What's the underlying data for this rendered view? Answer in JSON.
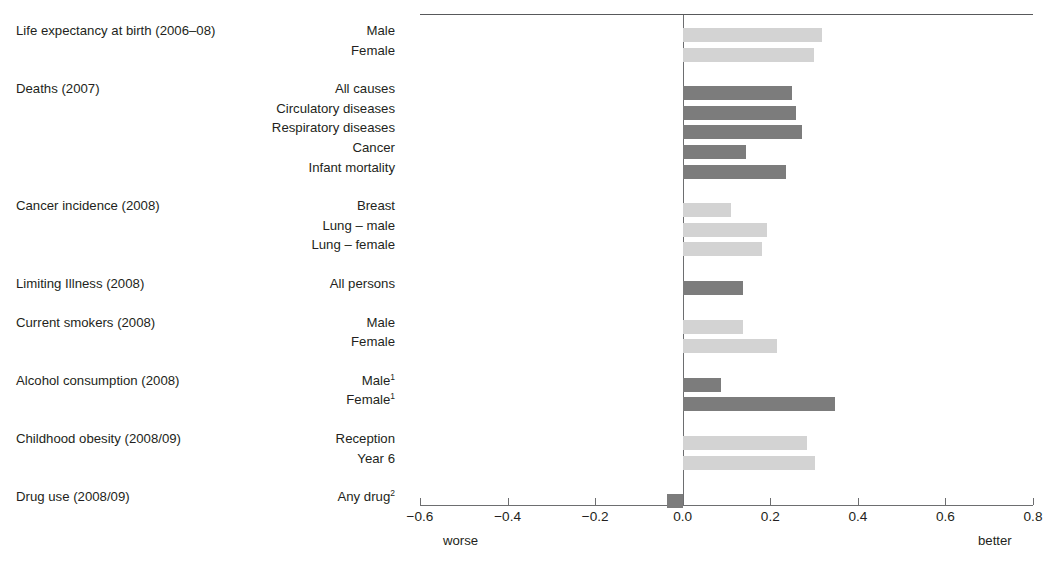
{
  "figure": {
    "cut_off_title_sliver": "",
    "axis": {
      "ticks": [
        "-0.6",
        "-0.4",
        "-0.2",
        "0.0",
        "0.2",
        "0.4",
        "0.6",
        "0.8"
      ],
      "tick_values": [
        -0.6,
        -0.4,
        -0.2,
        0.0,
        0.2,
        0.4,
        0.6,
        0.8
      ],
      "left_note": "worse",
      "right_note": "better"
    },
    "colors": {
      "bar_light": "#d3d3d3",
      "bar_dark": "#7c7c7c",
      "axis": "#6d6e70",
      "text": "#231f20"
    }
  },
  "chart_data": {
    "type": "bar",
    "orientation": "horizontal",
    "title": "",
    "xlabel": "",
    "ylabel": "",
    "xlim": [
      -0.6,
      0.8
    ],
    "grid": false,
    "legend": null,
    "axis_annotations": {
      "left": "worse",
      "right": "better"
    },
    "groups": [
      {
        "group": "Life expectancy at birth (2006–08)",
        "items": [
          {
            "label": "Male",
            "value": 0.317,
            "shade": "light"
          },
          {
            "label": "Female",
            "value": 0.301,
            "shade": "light"
          }
        ]
      },
      {
        "group": "Deaths (2007)",
        "items": [
          {
            "label": "All causes",
            "value": 0.25,
            "shade": "dark"
          },
          {
            "label": "Circulatory diseases",
            "value": 0.258,
            "shade": "dark"
          },
          {
            "label": "Respiratory diseases",
            "value": 0.272,
            "shade": "dark"
          },
          {
            "label": "Cancer",
            "value": 0.145,
            "shade": "dark"
          },
          {
            "label": "Infant mortality",
            "value": 0.237,
            "shade": "dark"
          }
        ]
      },
      {
        "group": "Cancer incidence (2008)",
        "items": [
          {
            "label": "Breast",
            "value": 0.11,
            "shade": "light"
          },
          {
            "label": "Lung – male",
            "value": 0.192,
            "shade": "light"
          },
          {
            "label": "Lung – female",
            "value": 0.18,
            "shade": "light"
          }
        ]
      },
      {
        "group": "Limiting Illness (2008)",
        "items": [
          {
            "label": "All persons",
            "value": 0.138,
            "shade": "dark"
          }
        ]
      },
      {
        "group": "Current smokers (2008)",
        "items": [
          {
            "label": "Male",
            "value": 0.137,
            "shade": "light"
          },
          {
            "label": "Female",
            "value": 0.215,
            "shade": "light"
          }
        ]
      },
      {
        "group": "Alcohol consumption (2008)",
        "items": [
          {
            "label": "Male",
            "footnote": "1",
            "value": 0.088,
            "shade": "dark"
          },
          {
            "label": "Female",
            "footnote": "1",
            "value": 0.348,
            "shade": "dark"
          }
        ]
      },
      {
        "group": "Childhood obesity (2008/09)",
        "items": [
          {
            "label": "Reception",
            "value": 0.285,
            "shade": "light"
          },
          {
            "label": "Year 6",
            "value": 0.302,
            "shade": "light"
          }
        ]
      },
      {
        "group": "Drug use (2008/09)",
        "items": [
          {
            "label": "Any drug",
            "footnote": "2",
            "value": -0.036,
            "shade": "dark"
          }
        ]
      }
    ]
  }
}
